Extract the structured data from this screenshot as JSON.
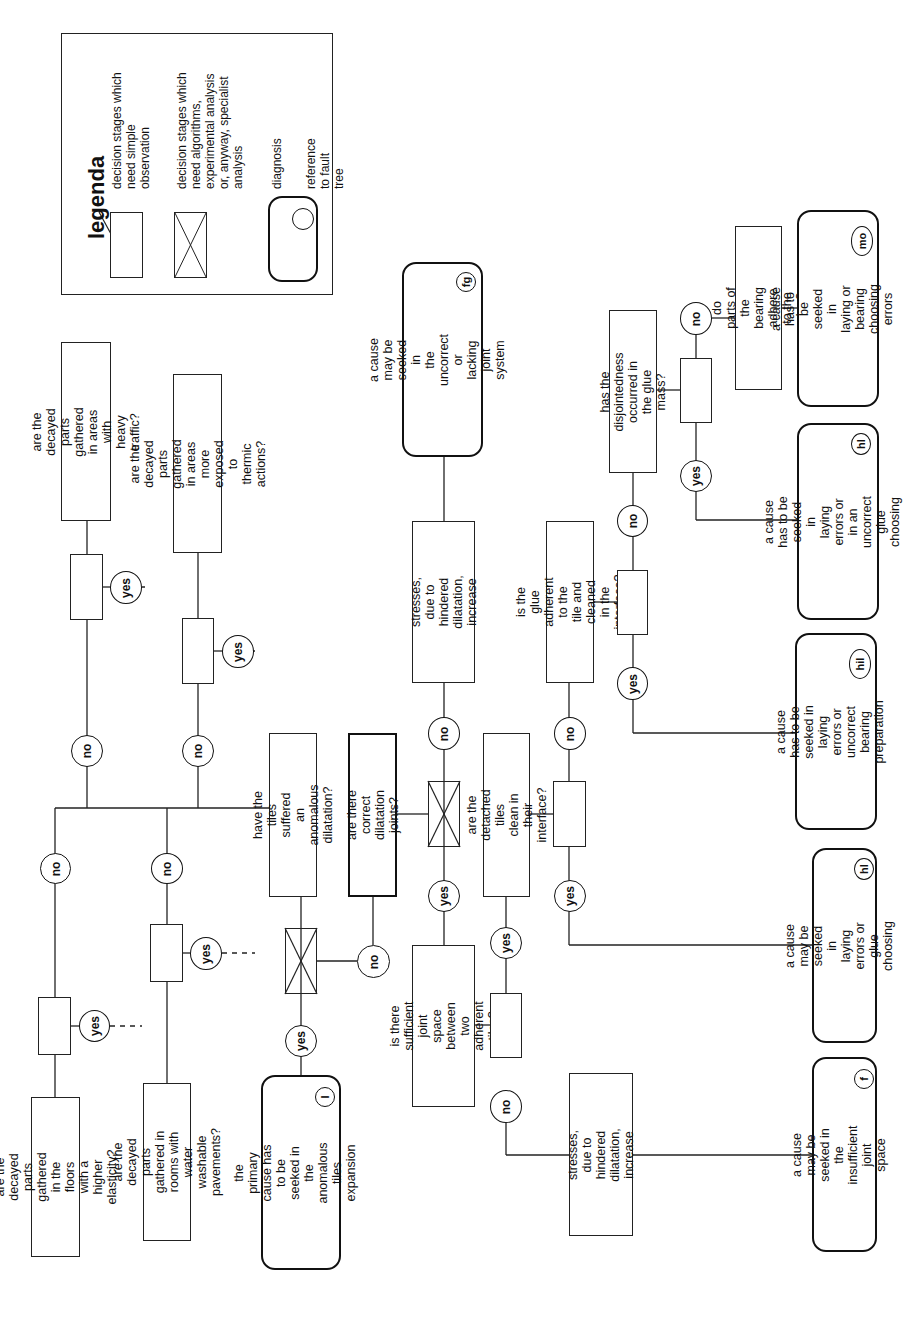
{
  "legend": {
    "title": "legenda",
    "simple": "decision stages which\nneed simple\nobservation",
    "specialist": "decision stages which\nneed algorithms,\nexperimental analysis\nor, anyway, specialist\nanalysis",
    "diagnosis": "diagnosis",
    "reference": "reference to fault tree"
  },
  "labels": {
    "yes": "yes",
    "no": "no"
  },
  "questions": {
    "heavy_traffic": "are the decayed parts\ngathered in areas with heavy\ntraffic?",
    "thermic": "are the decayed parts\ngathered in areas more\nexposed to thermic actions?",
    "elasticity": "are the decayed parts\ngathered in the floors with a\nhigher elasticity?",
    "water": "are the decayed parts\ngathered in rooms with water\nwashable pavements?",
    "anomalous": "have the tiles suffered an\nanomalous dilatation?",
    "joints": "are there correct\ndilatation joints?",
    "detached": "are the detached tiles\nclean in their interface?",
    "sufficient": "is there sufficient joint\nspace between two\nadherent tiles?",
    "glue_adherent": "is the glue adherent to the\ntile and cleaned in the\ninterface?",
    "disjointedness": "has the disjointedness\noccurred in the glue\nmass?",
    "bearing_parts": "do parts of the bearing\nadhere to the glue?"
  },
  "statements": {
    "stresses_upper": "stresses, due to hindered\ndilatation, increase",
    "stresses_lower": "stresses, due to hindered\ndilatation, increase"
  },
  "diagnoses": {
    "fg": {
      "text": "a cause may be seeked in\nthe uncorrect or lacking joint\nsystem",
      "ref": "fg"
    },
    "mo": {
      "text": "a cause  has to be seeked in\nlaying or bearing choosing\nerrors",
      "ref": "mo"
    },
    "hl_upper": {
      "text": "a cause  has to be seeked in\nlaying errors or in an\nuncorrect glue choosing",
      "ref": "hl"
    },
    "hil": {
      "text": "a cause  has to be seeked in\nlaying errors or uncorrect\nbearing preparation",
      "ref": "hil"
    },
    "hl_lower": {
      "text": "a cause may be seeked in\nlaying errors or glue\nchoosing",
      "ref": "hl"
    },
    "f": {
      "text": "a cause may be seeked in\nthe insufficient joint space",
      "ref": "f"
    },
    "I": {
      "text": "the primary cause has to be\nseeked in the anomalous\ntiles expansion",
      "ref": "I"
    }
  }
}
